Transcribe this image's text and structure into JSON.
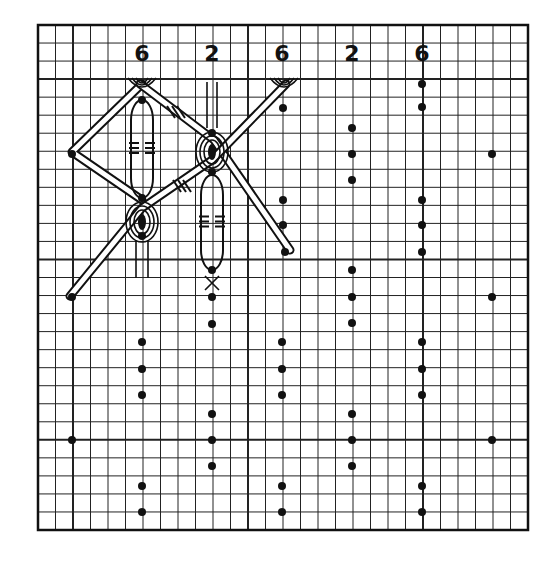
{
  "diagram": {
    "colors": {
      "ink": "#111111",
      "paper": "#ffffff",
      "grid": "#222222"
    },
    "grid": {
      "left": 38,
      "top": 25,
      "right": 528,
      "bottom": 530,
      "cols": 28,
      "rows": 28,
      "heavy_cols": [
        2,
        12,
        22
      ],
      "heavy_rows": [
        3,
        13,
        23
      ]
    },
    "column_labels": [
      {
        "text": "6",
        "x": 142,
        "y": 54
      },
      {
        "text": "2",
        "x": 212,
        "y": 54
      },
      {
        "text": "6",
        "x": 282,
        "y": 54
      },
      {
        "text": "2",
        "x": 352,
        "y": 54
      },
      {
        "text": "6",
        "x": 422,
        "y": 54
      }
    ],
    "pin_dots": [
      [
        142,
        100
      ],
      [
        142,
        198
      ],
      [
        142,
        236
      ],
      [
        212,
        133
      ],
      [
        212,
        172
      ],
      [
        212,
        270
      ],
      [
        212,
        297
      ],
      [
        212,
        324
      ],
      [
        283,
        108
      ],
      [
        283,
        200
      ],
      [
        283,
        225
      ],
      [
        285,
        252
      ],
      [
        352,
        128
      ],
      [
        352,
        154
      ],
      [
        352,
        180
      ],
      [
        352,
        270
      ],
      [
        352,
        297
      ],
      [
        352,
        323
      ],
      [
        422,
        84
      ],
      [
        422,
        107
      ],
      [
        422,
        200
      ],
      [
        422,
        225
      ],
      [
        422,
        252
      ],
      [
        72,
        154
      ],
      [
        72,
        297
      ],
      [
        492,
        154
      ],
      [
        492,
        297
      ],
      [
        142,
        342
      ],
      [
        142,
        369
      ],
      [
        142,
        395
      ],
      [
        212,
        414
      ],
      [
        212,
        440
      ],
      [
        212,
        466
      ],
      [
        282,
        342
      ],
      [
        282,
        369
      ],
      [
        282,
        395
      ],
      [
        352,
        414
      ],
      [
        352,
        440
      ],
      [
        352,
        466
      ],
      [
        422,
        342
      ],
      [
        422,
        369
      ],
      [
        422,
        395
      ],
      [
        72,
        440
      ],
      [
        492,
        440
      ],
      [
        142,
        486
      ],
      [
        142,
        512
      ],
      [
        282,
        486
      ],
      [
        282,
        512
      ],
      [
        422,
        486
      ],
      [
        422,
        512
      ]
    ],
    "threads": {
      "left_diagonal_upper": [
        [
          142,
          82
        ],
        [
          72,
          154
        ]
      ],
      "left_diagonal_lower": [
        [
          72,
          154
        ],
        [
          142,
          198
        ]
      ],
      "main_diagonal_a": [
        [
          142,
          82
        ],
        [
          212,
          133
        ],
        [
          288,
          252
        ]
      ],
      "main_diagonal_b": [
        [
          286,
          82
        ],
        [
          212,
          170
        ],
        [
          142,
          210
        ],
        [
          72,
          297
        ]
      ],
      "vertical_loop_1": {
        "x": 142,
        "top": 100,
        "bottom": 198
      },
      "vertical_loop_2": {
        "x": 212,
        "top": 175,
        "bottom": 270
      }
    }
  }
}
